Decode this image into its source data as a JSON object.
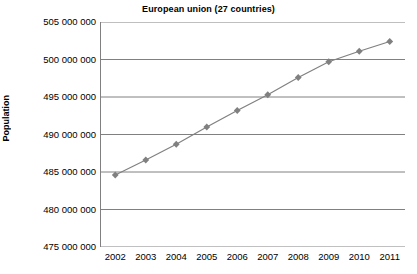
{
  "chart_data": {
    "type": "line",
    "title": "European union (27 countries)",
    "xlabel": "",
    "ylabel": "Population",
    "categories": [
      "2002",
      "2003",
      "2004",
      "2005",
      "2006",
      "2007",
      "2008",
      "2009",
      "2010",
      "2011"
    ],
    "values": [
      484600000,
      486600000,
      488700000,
      491000000,
      493200000,
      495300000,
      497600000,
      499700000,
      501100000,
      502400000
    ],
    "ylim": [
      475000000,
      505000000
    ],
    "ytick_labels": [
      "505 000 000",
      "500 000 000",
      "495 000 000",
      "490 000 000",
      "485 000 000",
      "480 000 000",
      "475 000 000"
    ],
    "ytick_values": [
      505000000,
      500000000,
      495000000,
      490000000,
      485000000,
      480000000,
      475000000
    ],
    "grid": true,
    "legend": false,
    "series_color": "#808080",
    "gridline_color": "#808080",
    "marker": "diamond"
  }
}
